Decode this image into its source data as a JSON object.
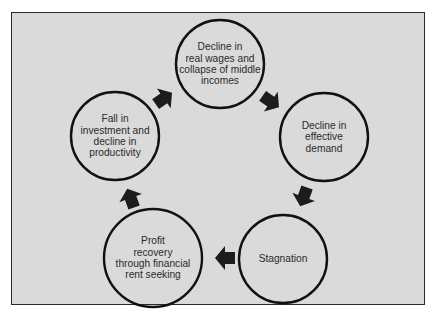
{
  "diagram": {
    "type": "cycle",
    "colors": {
      "background": "#dadada",
      "frame": "#2a2a2a",
      "circle_stroke": "#111111",
      "arrow": "#1c1c1c",
      "text": "#2a2a2a"
    },
    "nodes": [
      {
        "id": "wages",
        "label": "Decline in real wages and collapse of middle incomes",
        "lines": [
          "Decline in",
          "real wages and",
          "collapse of middle",
          "incomes"
        ]
      },
      {
        "id": "demand",
        "label": "Decline in effective demand",
        "lines": [
          "Decline in",
          "effective",
          "demand"
        ]
      },
      {
        "id": "stagnation",
        "label": "Stagnation",
        "lines": [
          "Stagnation"
        ]
      },
      {
        "id": "profit",
        "label": "Profit recovery through financial rent seeking",
        "lines": [
          "Profit",
          "recovery",
          "through financial",
          "rent seeking"
        ]
      },
      {
        "id": "investment",
        "label": "Fall in investment and decline in productivity",
        "lines": [
          "Fall in",
          "investment and",
          "decline in",
          "productivity"
        ]
      }
    ],
    "edges": [
      {
        "from": "wages",
        "to": "demand"
      },
      {
        "from": "demand",
        "to": "stagnation"
      },
      {
        "from": "stagnation",
        "to": "profit"
      },
      {
        "from": "profit",
        "to": "investment"
      },
      {
        "from": "investment",
        "to": "wages"
      }
    ]
  }
}
